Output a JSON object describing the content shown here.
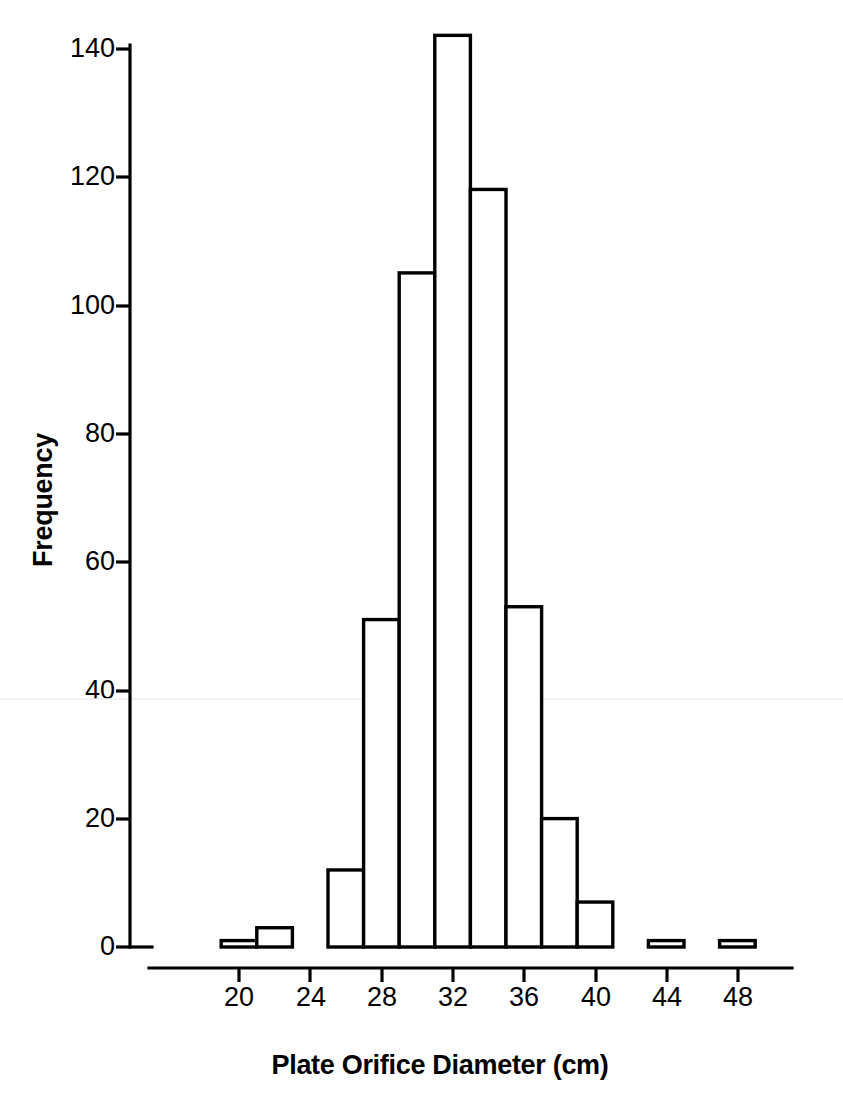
{
  "figure": {
    "background_color": "#ffffff",
    "ink_color": "#000000"
  },
  "chart_data": {
    "type": "bar",
    "title": "",
    "xlabel": "Plate Orifice Diameter (cm)",
    "ylabel": "Frequency",
    "bin_width": 2,
    "categories": [
      "19-21",
      "21-23",
      "23-25",
      "25-27",
      "27-29",
      "29-31",
      "31-33",
      "33-35",
      "35-37",
      "37-39",
      "39-41",
      "41-43",
      "43-45",
      "45-47",
      "47-49"
    ],
    "bin_edges": [
      19,
      21,
      23,
      25,
      27,
      29,
      31,
      33,
      35,
      37,
      39,
      41,
      43,
      45,
      47,
      49
    ],
    "values": [
      1,
      3,
      0,
      12,
      51,
      105,
      142,
      118,
      53,
      20,
      7,
      0,
      1,
      0,
      1
    ],
    "xlim": [
      17.5,
      50.5
    ],
    "ylim": [
      0,
      147
    ],
    "xticks": [
      20,
      24,
      28,
      32,
      36,
      40,
      44,
      48
    ],
    "xtick_labels": [
      "20",
      "24",
      "28",
      "32",
      "36",
      "40",
      "44",
      "48"
    ],
    "yticks": [
      0,
      20,
      40,
      60,
      80,
      100,
      120,
      140
    ],
    "ytick_labels": [
      "0",
      "20",
      "40",
      "60",
      "80",
      "100",
      "120",
      "140"
    ],
    "grid": false,
    "legend": null,
    "bar_fill": "#ffffff",
    "bar_stroke": "#000000"
  }
}
